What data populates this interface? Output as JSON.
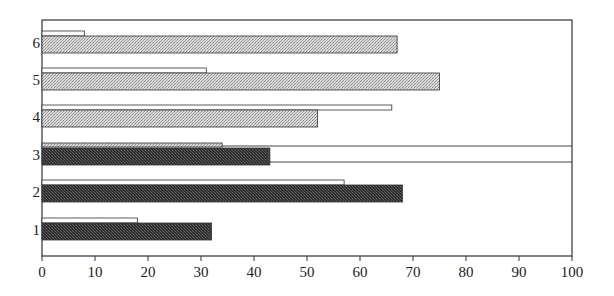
{
  "chart_data": {
    "type": "bar",
    "orientation": "horizontal",
    "title": "",
    "xlabel": "",
    "ylabel": "",
    "xlim": [
      0,
      100
    ],
    "x_ticks": [
      0,
      10,
      20,
      30,
      40,
      50,
      60,
      70,
      80,
      90,
      100
    ],
    "categories": [
      "1",
      "2",
      "3",
      "4",
      "5",
      "6"
    ],
    "grid": false,
    "legend": null,
    "series": [
      {
        "name": "upper (thin/outline) bar",
        "values": [
          18,
          57,
          34,
          66,
          31,
          8
        ]
      },
      {
        "name": "lower (filled) bar",
        "values": [
          32,
          68,
          43,
          52,
          75,
          67
        ]
      }
    ],
    "bar_styles": {
      "1": {
        "upper": "white",
        "lower": "dark"
      },
      "2": {
        "upper": "white",
        "lower": "dark"
      },
      "3": {
        "upper": "light",
        "lower": "dark"
      },
      "4": {
        "upper": "white",
        "lower": "light"
      },
      "5": {
        "upper": "white",
        "lower": "light"
      },
      "6": {
        "upper": "white",
        "lower": "light"
      }
    },
    "annotations": [
      {
        "type": "horizontal-line",
        "description": "two horizontal reference lines across the chart bracketing category 3"
      }
    ]
  },
  "colors": {
    "dark_fill": "#3a3a3a",
    "light_fill": "#c8c8c8",
    "white_fill": "#ffffff",
    "stroke": "#333333"
  }
}
